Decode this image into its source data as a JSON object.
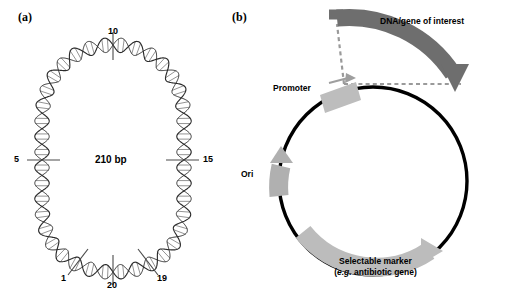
{
  "figure": {
    "panels": [
      {
        "label": "(a)",
        "name": "dna-minicircle-panel",
        "center_label": "210 bp",
        "tick_labels": [
          {
            "text": "10",
            "name": "tick-label-10",
            "position": "top"
          },
          {
            "text": "5",
            "name": "tick-label-5",
            "position": "left"
          },
          {
            "text": "15",
            "name": "tick-label-15",
            "position": "right"
          },
          {
            "text": "1",
            "name": "tick-label-1",
            "position": "bottom-left"
          },
          {
            "text": "20",
            "name": "tick-label-20",
            "position": "bottom"
          },
          {
            "text": "19",
            "name": "tick-label-19",
            "position": "bottom-right"
          }
        ]
      },
      {
        "label": "(b)",
        "name": "plasmid-vector-panel",
        "features": [
          {
            "name": "dna-gene-of-interest",
            "label": "DNA/gene of interest",
            "color": "#6e6e6e",
            "shape": "arc-arrow"
          },
          {
            "name": "promoter",
            "label": "Promoter",
            "color": "#bdbdbd",
            "shape": "box-arrow"
          },
          {
            "name": "ori",
            "label": "Ori",
            "color": "#b0b0b0",
            "shape": "arc-arrow"
          },
          {
            "name": "selectable-marker",
            "label_line1": "Selectable marker",
            "label_line2_italic": "e.g.",
            "label_line2_rest": " antibiotic gene)",
            "label_line2_prefix": "(",
            "color": "#bcbcbc",
            "shape": "arc-arrow"
          }
        ],
        "backbone": {
          "name": "plasmid-backbone",
          "color": "#000000"
        },
        "connectors": {
          "name": "insertion-dashed-connector",
          "color": "#9a9a9a",
          "style": "dashed"
        }
      }
    ]
  },
  "colors": {
    "background": "#ffffff",
    "ink": "#000000",
    "gene_dark_gray": "#6e6e6e",
    "feature_light_gray": "#bdbdbd",
    "dash_gray": "#9a9a9a"
  }
}
